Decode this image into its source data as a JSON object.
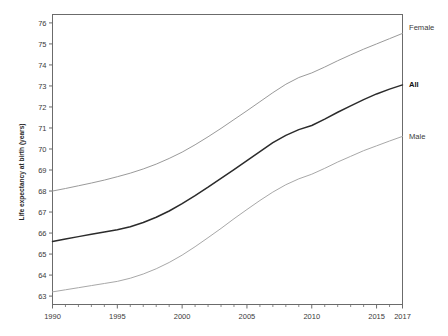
{
  "chart_data": {
    "type": "line",
    "title": "",
    "xlabel": "",
    "ylabel": "Life expectancy at birth (years)",
    "xlim": [
      1990,
      2017
    ],
    "ylim": [
      62.6,
      76.4
    ],
    "grid": false,
    "legend_position": "right-outside",
    "x_ticks": [
      "1990",
      "1995",
      "2000",
      "2005",
      "2010",
      "2015",
      "2017"
    ],
    "x_tick_values": [
      1990,
      1995,
      2000,
      2005,
      2010,
      2015,
      2017
    ],
    "y_ticks": [
      "63",
      "64",
      "65",
      "66",
      "67",
      "68",
      "69",
      "70",
      "71",
      "72",
      "73",
      "74",
      "75",
      "76"
    ],
    "y_tick_values": [
      63,
      64,
      65,
      66,
      67,
      68,
      69,
      70,
      71,
      72,
      73,
      74,
      75,
      76
    ],
    "x": [
      1990,
      1991,
      1992,
      1993,
      1994,
      1995,
      1996,
      1997,
      1998,
      1999,
      2000,
      2001,
      2002,
      2003,
      2004,
      2005,
      2006,
      2007,
      2008,
      2009,
      2010,
      2011,
      2012,
      2013,
      2014,
      2015,
      2016,
      2017
    ],
    "series": [
      {
        "name": "Female",
        "color": "#9a9a9a",
        "width": 1.0,
        "label": "Female",
        "values": [
          68.0,
          68.12,
          68.25,
          68.38,
          68.52,
          68.68,
          68.85,
          69.05,
          69.28,
          69.55,
          69.85,
          70.2,
          70.58,
          70.98,
          71.4,
          71.82,
          72.25,
          72.68,
          73.08,
          73.4,
          73.62,
          73.9,
          74.2,
          74.48,
          74.75,
          75.0,
          75.25,
          75.5
        ]
      },
      {
        "name": "All",
        "color": "#2b2b2b",
        "width": 1.5,
        "label": "All",
        "values": [
          65.6,
          65.72,
          65.83,
          65.94,
          66.05,
          66.16,
          66.3,
          66.5,
          66.75,
          67.05,
          67.4,
          67.78,
          68.18,
          68.6,
          69.02,
          69.45,
          69.88,
          70.3,
          70.65,
          70.92,
          71.12,
          71.42,
          71.75,
          72.05,
          72.35,
          72.62,
          72.85,
          73.05
        ]
      },
      {
        "name": "Male",
        "color": "#a8a8a8",
        "width": 1.0,
        "label": "Male",
        "values": [
          63.2,
          63.3,
          63.4,
          63.5,
          63.6,
          63.7,
          63.85,
          64.05,
          64.3,
          64.6,
          64.95,
          65.35,
          65.78,
          66.22,
          66.68,
          67.12,
          67.55,
          67.95,
          68.3,
          68.58,
          68.8,
          69.08,
          69.38,
          69.65,
          69.92,
          70.15,
          70.38,
          70.6
        ]
      }
    ]
  },
  "axes": {
    "frame_color": "#6b6b6b",
    "tick_color": "#6b6b6b"
  }
}
